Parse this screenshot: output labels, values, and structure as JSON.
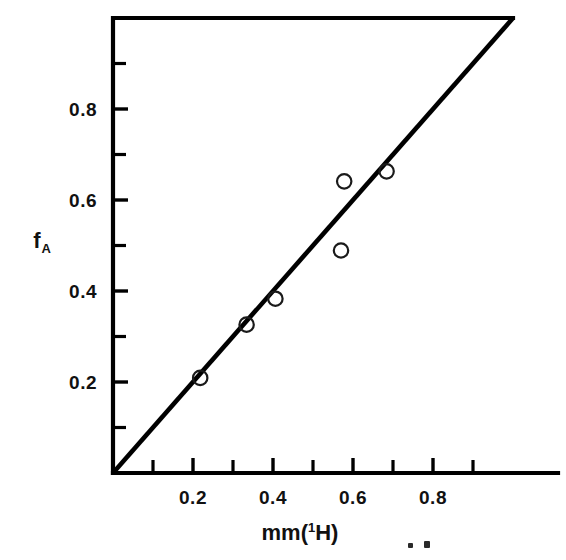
{
  "figure": {
    "background_color": "#ffffff",
    "ink_color": "#000000"
  },
  "chart_data": {
    "type": "scatter",
    "title": "",
    "subtitle": "",
    "xlabel": "mm('H)",
    "xlabel_parts": {
      "base_left": "mm(",
      "superscript": "1",
      "base_right": "H)"
    },
    "ylabel": "fA",
    "ylabel_parts": {
      "base": "f",
      "subscript": "A"
    },
    "xlim": [
      0.0,
      1.0
    ],
    "ylim": [
      0.0,
      1.0
    ],
    "xticks_major": [
      0.2,
      0.4,
      0.6,
      0.8
    ],
    "xticklabels": [
      "0.2",
      "0.4",
      "0.6",
      "0.8"
    ],
    "xticks_minor": [
      0.1,
      0.3,
      0.5,
      0.7,
      0.9
    ],
    "yticks_major": [
      0.2,
      0.4,
      0.6,
      0.8
    ],
    "yticklabels": [
      "0.2",
      "0.4",
      "0.6",
      "0.8"
    ],
    "yticks_minor": [
      0.1,
      0.3,
      0.5,
      0.7,
      0.9
    ],
    "grid": false,
    "legend": false,
    "legend_position": "none",
    "marker_style": "open-circle",
    "series": [
      {
        "name": "observed",
        "type": "scatter",
        "marker": "open-circle",
        "x": [
          0.218,
          0.334,
          0.406,
          0.57,
          0.578,
          0.684
        ],
        "y": [
          0.209,
          0.326,
          0.383,
          0.489,
          0.641,
          0.663
        ],
        "points": [
          {
            "x": 0.218,
            "y": 0.209
          },
          {
            "x": 0.334,
            "y": 0.326
          },
          {
            "x": 0.406,
            "y": 0.383
          },
          {
            "x": 0.57,
            "y": 0.489
          },
          {
            "x": 0.578,
            "y": 0.641
          },
          {
            "x": 0.684,
            "y": 0.663
          }
        ]
      },
      {
        "name": "identity-line",
        "type": "line",
        "line_from": {
          "x": 0.0,
          "y": 0.0
        },
        "line_to": {
          "x": 1.0,
          "y": 1.0
        },
        "slope": 1.0,
        "intercept": 0.0
      }
    ],
    "annotations": []
  },
  "artifacts": {
    "specks": [
      {
        "x": 408,
        "y": 543,
        "w": 5,
        "h": 5
      },
      {
        "x": 424,
        "y": 541,
        "w": 6,
        "h": 7
      }
    ]
  }
}
